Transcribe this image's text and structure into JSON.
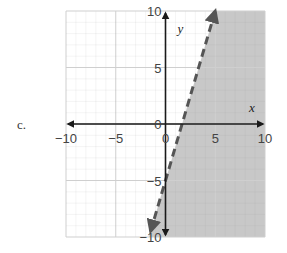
{
  "problem_label": "c.",
  "chart_data": {
    "type": "line",
    "title": "",
    "xlabel": "x",
    "ylabel": "y",
    "xlim": [
      -10,
      10
    ],
    "ylim": [
      -10,
      10
    ],
    "grid": true,
    "x_ticks": [
      "-10",
      "-5",
      "0",
      "5",
      "10"
    ],
    "y_ticks": [
      "10",
      "5",
      "0",
      "-5",
      "-10"
    ],
    "series": [
      {
        "name": "boundary line y = 3x - 5",
        "style": "dashed",
        "slope": 3,
        "intercept": -5,
        "x": [
          -1.67,
          5
        ],
        "y": [
          -10,
          10
        ]
      }
    ],
    "shaded_region": {
      "inequality": "y < 3x - 5",
      "side": "right/below line",
      "color": "#c8c8c8"
    },
    "colors": {
      "shade": "#c8c8c8",
      "line": "#555555",
      "axes": "#1a1a1a",
      "grid": "#d8d8d8"
    }
  }
}
